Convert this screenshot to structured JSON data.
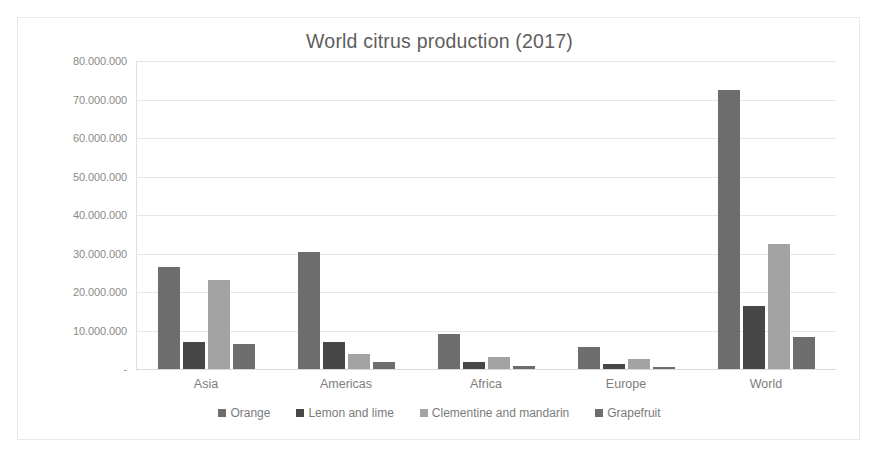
{
  "chart_data": {
    "type": "bar",
    "title": "World citrus production (2017)",
    "xlabel": "",
    "ylabel": "",
    "categories": [
      "Asia",
      "Americas",
      "Africa",
      "Europe",
      "World"
    ],
    "series": [
      {
        "name": "Orange",
        "color": "#6d6d6d",
        "values": [
          26500000,
          30500000,
          9000000,
          5800000,
          72500000
        ]
      },
      {
        "name": "Lemon and lime",
        "color": "#474747",
        "values": [
          7000000,
          7000000,
          1800000,
          1200000,
          16300000
        ]
      },
      {
        "name": "Clementine and mandarin",
        "color": "#a3a3a3",
        "values": [
          23200000,
          4000000,
          3000000,
          2700000,
          32500000
        ]
      },
      {
        "name": "Grapefruit",
        "color": "#6d6d6d",
        "values": [
          6600000,
          1800000,
          800000,
          500000,
          8300000
        ]
      }
    ],
    "ylim": [
      0,
      80000000
    ],
    "ytick_labels": [
      "80.000.000",
      "70.000.000",
      "60.000.000",
      "50.000.000",
      "40.000.000",
      "30.000.000",
      "20.000.000",
      "10.000.000",
      "-"
    ],
    "ytick_values": [
      80000000,
      70000000,
      60000000,
      50000000,
      40000000,
      30000000,
      20000000,
      10000000,
      0
    ],
    "grid": true,
    "legend_position": "bottom",
    "title_color": "#5e5e5e",
    "axis_text_color": "#8a8a8a",
    "gridline_color": "#e6e6e6",
    "background_color": "#ffffff",
    "border_color": "#e9e9e9"
  }
}
